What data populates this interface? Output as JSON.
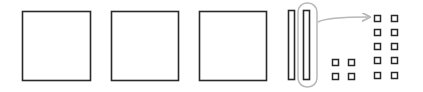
{
  "diagram": {
    "colors": {
      "stroke": "#2a2a2a",
      "highlight": "#b8b8b8",
      "background": "#ffffff"
    },
    "large_squares": [
      {
        "x": 22.5,
        "y": 11.5,
        "w": 68,
        "h": 69
      },
      {
        "x": 111.5,
        "y": 11.5,
        "w": 67,
        "h": 69
      },
      {
        "x": 199.5,
        "y": 11.5,
        "w": 67,
        "h": 69
      }
    ],
    "thin_rects": [
      {
        "x": 288.5,
        "y": 10.5,
        "w": 6,
        "h": 69
      },
      {
        "x": 303.5,
        "y": 10.5,
        "w": 6,
        "h": 69
      }
    ],
    "highlight_oval": {
      "x": 298,
      "y": 3,
      "w": 19,
      "h": 84,
      "r": 9
    },
    "arrow": {
      "from": [
        318,
        22
      ],
      "to": [
        369,
        17
      ]
    },
    "small_grid_left": {
      "cols": [
        332,
        348
      ],
      "rows": [
        59,
        73
      ],
      "size": 6
    },
    "small_grid_right": {
      "cols": [
        374,
        391
      ],
      "rows": [
        15,
        29,
        43,
        57,
        72
      ],
      "size": 6
    }
  }
}
